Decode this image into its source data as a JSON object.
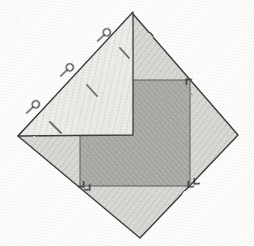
{
  "figure": {
    "medium": "pencil on paper",
    "canvas": {
      "width": 254,
      "height": 246,
      "background": "#fdfdfc"
    },
    "stroke_color": "#4a4a4a",
    "shapes": [
      {
        "id": "diamond",
        "name": "rotated-square-diamond",
        "kind": "polygon",
        "points": "133,14 238,135 140,238 18,136",
        "fill": "#d9d9d6",
        "fill_opacity": 0.75,
        "stroke": "#3d3d3d",
        "stroke_width": 1.4
      },
      {
        "id": "inner-square",
        "name": "inner-axis-aligned-square",
        "kind": "polygon",
        "points": "80,80 190,80 190,186 80,186",
        "fill": "#a9a9a6",
        "fill_opacity": 0.72,
        "stroke": "#5a5a5a",
        "stroke_width": 1.0
      },
      {
        "id": "triangle",
        "name": "overlapping-triangle",
        "kind": "polygon",
        "points": "133,12 133,135 18,136",
        "fill": "#f0f0ee",
        "fill_opacity": 0.92,
        "stroke": "#3d3d3d",
        "stroke_width": 1.3
      }
    ],
    "q_marks": [
      {
        "label": "q-mark-1",
        "cx": 103,
        "cy": 36,
        "angle": 46
      },
      {
        "label": "q-mark-2",
        "cx": 66,
        "cy": 71,
        "angle": 46
      },
      {
        "label": "q-mark-3",
        "cx": 32,
        "cy": 108,
        "angle": 46
      }
    ],
    "dash_marks": [
      {
        "label": "dash-mark-1",
        "x1": 120,
        "y1": 48,
        "x2": 129,
        "y2": 58
      },
      {
        "label": "dash-mark-2",
        "x1": 87,
        "y1": 85,
        "x2": 97,
        "y2": 96
      },
      {
        "label": "dash-mark-3",
        "x1": 50,
        "y1": 122,
        "x2": 61,
        "y2": 133
      }
    ],
    "arrow_ticks": [
      {
        "label": "arrow-tick-top-right",
        "cx": 186,
        "cy": 79,
        "angle": 225
      },
      {
        "label": "arrow-tick-bottom-left",
        "cx": 84,
        "cy": 187,
        "angle": 45
      },
      {
        "label": "arrow-tick-bottom-left-2",
        "cx": 90,
        "cy": 190,
        "angle": 45
      },
      {
        "label": "arrow-tick-bottom-right",
        "cx": 188,
        "cy": 187,
        "angle": 135
      },
      {
        "label": "arrow-tick-bottom-right-2",
        "cx": 194,
        "cy": 184,
        "angle": 135
      }
    ],
    "shading_note": "graphite hatching on all filled regions"
  }
}
